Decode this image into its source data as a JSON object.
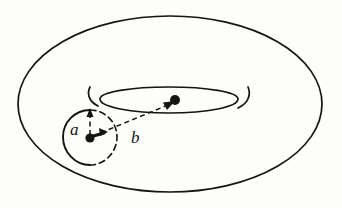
{
  "figure": {
    "kind": "torus-diagram",
    "background_color": "#fdfdfc",
    "ink_color": "#16140f"
  },
  "labels": [
    {
      "id": "a",
      "text": "a",
      "meaning": "tube radius of the torus (radius of the small cross-section circle)",
      "x": 78,
      "y": 130
    },
    {
      "id": "b",
      "text": "b",
      "meaning": "distance from the centre of the torus to the centre of the tube",
      "x": 139,
      "y": 138
    }
  ],
  "geometry": {
    "outer_ellipse": {
      "cx": 170,
      "cy": 104,
      "rx": 152,
      "ry": 88
    },
    "inner_hole_ellipse": {
      "cx": 169,
      "cy": 100,
      "rx": 69,
      "ry": 13
    },
    "cross_section_circle": {
      "cx": 90,
      "cy": 137,
      "r": 27,
      "solid_side": "left",
      "dashed_side": "right"
    },
    "tube_center_point": {
      "x": 90,
      "y": 137
    },
    "torus_center_point": {
      "x": 173,
      "y": 102
    },
    "radius_a_vector": {
      "x1": 90,
      "y1": 137,
      "x2": 90,
      "y2": 110
    },
    "radius_b_vector": {
      "x1": 90,
      "y1": 137,
      "x2": 173,
      "y2": 102
    }
  },
  "style": {
    "stroke_width": 1.7,
    "dash_pattern": "6 4"
  }
}
